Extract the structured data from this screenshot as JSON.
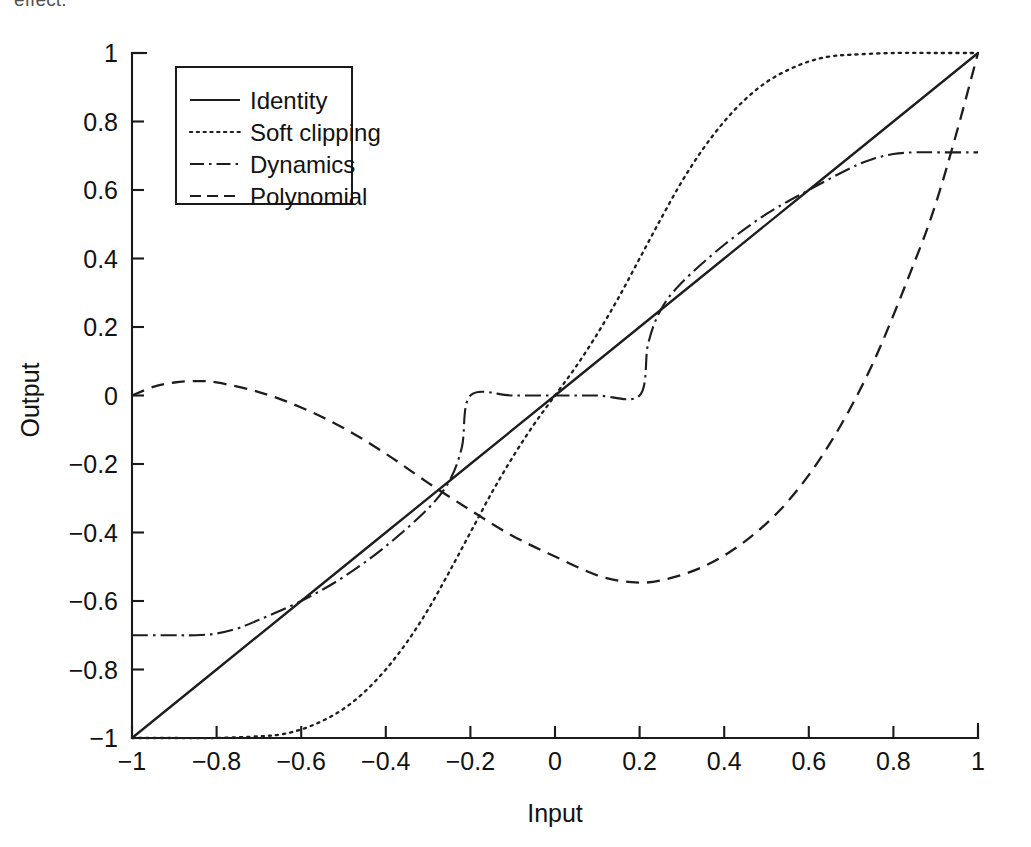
{
  "page": {
    "clipped_body_text": "effect."
  },
  "chart_data": {
    "type": "line",
    "title": "",
    "xlabel": "Input",
    "ylabel": "Output",
    "xlim": [
      -1,
      1
    ],
    "ylim": [
      -1,
      1
    ],
    "grid": false,
    "legend_position": "upper left",
    "xticks": [
      -1,
      -0.8,
      -0.6,
      -0.4,
      -0.2,
      0,
      0.2,
      0.4,
      0.6,
      0.8,
      1
    ],
    "xticklabels": [
      "-1",
      "-0.8",
      "-0.6",
      "-0.4",
      "-0.2",
      "0",
      "0.2",
      "0.4",
      "0.6",
      "0.8",
      "1"
    ],
    "yticks": [
      -1,
      -0.8,
      -0.6,
      -0.4,
      -0.2,
      0,
      0.2,
      0.4,
      0.6,
      0.8,
      1
    ],
    "yticklabels": [
      "-1",
      "-0.8",
      "-0.6",
      "-0.4",
      "-0.2",
      "0",
      "0.2",
      "0.4",
      "0.6",
      "0.8",
      "1"
    ],
    "series": [
      {
        "name": "Identity",
        "linestyle": "solid",
        "color": "#1d1d1d",
        "x": [
          -1,
          -0.8,
          -0.6,
          -0.4,
          -0.2,
          0,
          0.2,
          0.4,
          0.6,
          0.8,
          1
        ],
        "values": [
          -1,
          -0.8,
          -0.6,
          -0.4,
          -0.2,
          0,
          0.2,
          0.4,
          0.6,
          0.8,
          1
        ]
      },
      {
        "name": "Soft clipping",
        "linestyle": "dotted",
        "color": "#1d1d1d",
        "x": [
          -1,
          -0.9,
          -0.8,
          -0.7,
          -0.65,
          -0.6,
          -0.55,
          -0.5,
          -0.45,
          -0.4,
          -0.35,
          -0.3,
          -0.25,
          -0.2,
          -0.15,
          -0.1,
          -0.05,
          0,
          0.05,
          0.1,
          0.15,
          0.2,
          0.25,
          0.3,
          0.35,
          0.4,
          0.45,
          0.5,
          0.55,
          0.6,
          0.65,
          0.7,
          0.8,
          0.9,
          1
        ],
        "values": [
          -1,
          -1,
          -1,
          -0.995,
          -0.99,
          -0.975,
          -0.95,
          -0.915,
          -0.865,
          -0.8,
          -0.72,
          -0.625,
          -0.515,
          -0.4,
          -0.285,
          -0.18,
          -0.085,
          0,
          0.085,
          0.18,
          0.285,
          0.4,
          0.515,
          0.625,
          0.72,
          0.8,
          0.865,
          0.915,
          0.95,
          0.975,
          0.99,
          0.995,
          1,
          1,
          1
        ]
      },
      {
        "name": "Dynamics",
        "linestyle": "dashdot",
        "color": "#1d1d1d",
        "x": [
          -1,
          -0.9,
          -0.85,
          -0.8,
          -0.75,
          -0.7,
          -0.6,
          -0.5,
          -0.4,
          -0.3,
          -0.25,
          -0.22,
          -0.2,
          -0.1,
          0,
          0.1,
          0.2,
          0.22,
          0.25,
          0.3,
          0.4,
          0.5,
          0.6,
          0.7,
          0.75,
          0.8,
          0.85,
          0.9,
          1
        ],
        "values": [
          -0.7,
          -0.7,
          -0.7,
          -0.695,
          -0.68,
          -0.655,
          -0.6,
          -0.53,
          -0.44,
          -0.33,
          -0.25,
          -0.15,
          0,
          0,
          0,
          0,
          0,
          0.15,
          0.25,
          0.33,
          0.44,
          0.53,
          0.6,
          0.665,
          0.69,
          0.705,
          0.71,
          0.71,
          0.71
        ]
      },
      {
        "name": "Polynomial",
        "linestyle": "dashed",
        "color": "#1d1d1d",
        "x": [
          -1,
          -0.95,
          -0.9,
          -0.85,
          -0.8,
          -0.7,
          -0.6,
          -0.5,
          -0.4,
          -0.3,
          -0.2,
          -0.1,
          0,
          0.1,
          0.18,
          0.25,
          0.35,
          0.45,
          0.55,
          0.65,
          0.75,
          0.85,
          0.9,
          0.95,
          1
        ],
        "values": [
          0,
          0.025,
          0.038,
          0.042,
          0.038,
          0.01,
          -0.035,
          -0.095,
          -0.17,
          -0.255,
          -0.335,
          -0.41,
          -0.47,
          -0.525,
          -0.545,
          -0.54,
          -0.5,
          -0.425,
          -0.31,
          -0.14,
          0.09,
          0.39,
          0.56,
          0.77,
          1
        ]
      }
    ]
  },
  "legend": {
    "items": [
      {
        "label": "Identity",
        "style": "solid"
      },
      {
        "label": "Soft clipping",
        "style": "dotted"
      },
      {
        "label": "Dynamics",
        "style": "dashdot"
      },
      {
        "label": "Polynomial",
        "style": "dashed"
      }
    ]
  }
}
